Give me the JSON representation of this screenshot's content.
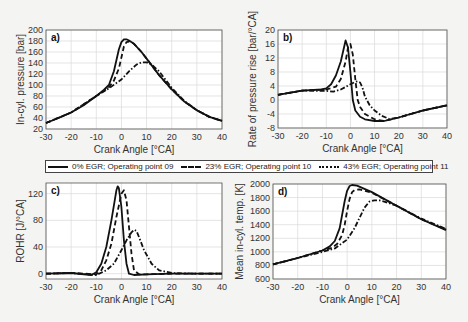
{
  "legend": {
    "items": [
      {
        "label": "0% EGR; Operating point 09",
        "style": "solid"
      },
      {
        "label": "23% EGR; Operating point 10",
        "style": "dashed"
      },
      {
        "label": "43% EGR; Operating point 11",
        "style": "dashdot"
      }
    ]
  },
  "chart_data": [
    {
      "panel": "a)",
      "type": "line",
      "xlabel": "Crank Angle [°CA]",
      "ylabel": "In-cyl. pressure [bar]",
      "xlim": [
        -30,
        40
      ],
      "ylim": [
        20,
        200
      ],
      "xticks": [
        -30,
        -20,
        -10,
        0,
        10,
        20,
        30,
        40
      ],
      "yticks": [
        20,
        40,
        60,
        80,
        100,
        120,
        140,
        160,
        180,
        200
      ],
      "grid": true,
      "box": {
        "x0": 46,
        "x1": 222,
        "y0": 30,
        "y1": 129
      },
      "series": [
        {
          "name": "0% EGR; Operating point 09",
          "style": "solid",
          "x": [
            -30,
            -25,
            -20,
            -15,
            -10,
            -7,
            -5,
            -3,
            -2,
            -1,
            0,
            1,
            2,
            3,
            5,
            8,
            10,
            15,
            20,
            25,
            30,
            35,
            40
          ],
          "y": [
            31,
            40,
            50,
            63,
            80,
            91,
            100,
            125,
            145,
            165,
            178,
            183,
            183,
            181,
            175,
            160,
            148,
            118,
            92,
            70,
            54,
            42,
            35
          ]
        },
        {
          "name": "23% EGR; Operating point 10",
          "style": "dashed",
          "x": [
            -30,
            -20,
            -10,
            -7,
            -5,
            -3,
            -1,
            0,
            1,
            2,
            3,
            5,
            8,
            10,
            15,
            20,
            25,
            30,
            35,
            40
          ],
          "y": [
            31,
            50,
            80,
            89,
            96,
            108,
            130,
            150,
            170,
            178,
            179,
            175,
            160,
            148,
            118,
            92,
            70,
            54,
            42,
            35
          ]
        },
        {
          "name": "43% EGR; Operating point 11",
          "style": "dashdot",
          "x": [
            -30,
            -20,
            -10,
            -5,
            0,
            3,
            6,
            8,
            10,
            12,
            15,
            20,
            25,
            30,
            35,
            40
          ],
          "y": [
            31,
            50,
            80,
            94,
            110,
            125,
            137,
            141,
            141,
            137,
            125,
            95,
            71,
            54,
            42,
            35
          ]
        }
      ]
    },
    {
      "panel": "b)",
      "type": "line",
      "xlabel": "Crank Angle [°CA]",
      "ylabel": "Rate of pressure rise [bar/°CA]",
      "xlim": [
        -30,
        40
      ],
      "ylim": [
        -8,
        20
      ],
      "xticks": [
        -30,
        -20,
        -10,
        0,
        10,
        20,
        30,
        40
      ],
      "yticks": [
        -8,
        -4,
        0,
        4,
        8,
        12,
        16,
        20
      ],
      "grid": true,
      "box": {
        "x0": 278,
        "x1": 447,
        "y0": 30,
        "y1": 128
      },
      "series": [
        {
          "name": "0% EGR; Operating point 09",
          "style": "solid",
          "x": [
            -30,
            -20,
            -12,
            -10,
            -8,
            -6,
            -4,
            -3,
            -2,
            -1,
            0,
            1,
            2,
            4,
            6,
            10,
            14,
            20,
            30,
            40
          ],
          "y": [
            1.5,
            2.7,
            3.0,
            3.3,
            4.5,
            7,
            11,
            14,
            17,
            15,
            8,
            0,
            -3,
            -4.8,
            -5.5,
            -6,
            -6,
            -5,
            -3,
            -1.5
          ]
        },
        {
          "name": "23% EGR; Operating point 10",
          "style": "dashed",
          "x": [
            -30,
            -20,
            -10,
            -6,
            -4,
            -2,
            -1,
            0,
            1,
            2,
            3,
            4,
            6,
            10,
            14,
            20,
            30,
            40
          ],
          "y": [
            1.5,
            2.7,
            3.0,
            3.8,
            6,
            11,
            15,
            16,
            13,
            6,
            0,
            -2,
            -4,
            -5.5,
            -6,
            -5,
            -3,
            -1.5
          ]
        },
        {
          "name": "43% EGR; Operating point 11",
          "style": "dashdot",
          "x": [
            -30,
            -20,
            -10,
            -7,
            -4,
            0,
            2,
            3,
            4,
            5,
            6,
            8,
            10,
            13,
            16,
            20,
            30,
            40
          ],
          "y": [
            1.5,
            2.7,
            2.6,
            2.4,
            3,
            4.5,
            5.2,
            5.3,
            5,
            3.5,
            1,
            -1.5,
            -3,
            -4.5,
            -5.4,
            -5,
            -3,
            -1.5
          ]
        }
      ]
    },
    {
      "panel": "c)",
      "type": "line",
      "xlabel": "Crank Angle [°CA]",
      "ylabel": "ROHR [J/°CA]",
      "xlim": [
        -30,
        40
      ],
      "ylim": [
        -8,
        136
      ],
      "xticks": [
        -30,
        -20,
        -10,
        0,
        10,
        20,
        30,
        40
      ],
      "yticks": [
        0,
        40,
        80,
        120
      ],
      "grid": true,
      "box": {
        "x0": 46,
        "x1": 222,
        "y0": 183,
        "y1": 279
      },
      "series": [
        {
          "name": "0% EGR; Operating point 09",
          "style": "solid",
          "x": [
            -30,
            -20,
            -12,
            -10,
            -8,
            -6,
            -4,
            -2,
            -1.5,
            -1,
            0,
            1,
            2,
            3,
            5,
            10,
            20,
            40
          ],
          "y": [
            0,
            1,
            -2,
            2,
            15,
            40,
            80,
            125,
            131,
            128,
            100,
            50,
            15,
            0,
            -2,
            -1,
            0,
            0
          ]
        },
        {
          "name": "23% EGR; Operating point 10",
          "style": "dashed",
          "x": [
            -30,
            -20,
            -10,
            -8,
            -6,
            -4,
            -2,
            0,
            1,
            2,
            3,
            4,
            5,
            7,
            10,
            20,
            40
          ],
          "y": [
            0,
            1,
            -1,
            5,
            20,
            45,
            85,
            120,
            125,
            110,
            70,
            30,
            5,
            -1,
            -1,
            0,
            0
          ]
        },
        {
          "name": "43% EGR; Operating point 11",
          "style": "dashdot",
          "x": [
            -30,
            -20,
            -10,
            -6,
            -3,
            0,
            2,
            4,
            5,
            6,
            7,
            9,
            12,
            15,
            20,
            30,
            40
          ],
          "y": [
            0,
            1,
            -2,
            5,
            15,
            35,
            50,
            62,
            66,
            64,
            55,
            35,
            15,
            5,
            1,
            0,
            0
          ]
        }
      ]
    },
    {
      "panel": "d)",
      "type": "line",
      "xlabel": "Crank Angle [°CA]",
      "ylabel": "Mean in-cyl. temp. [K]",
      "xlim": [
        -30,
        40
      ],
      "ylim": [
        600,
        2000
      ],
      "xticks": [
        -30,
        -20,
        -10,
        0,
        10,
        20,
        30,
        40
      ],
      "yticks": [
        600,
        800,
        1000,
        1200,
        1400,
        1600,
        1800,
        2000
      ],
      "grid": true,
      "box": {
        "x0": 273,
        "x1": 446,
        "y0": 184,
        "y1": 279
      },
      "series": [
        {
          "name": "0% EGR; Operating point 09",
          "style": "solid",
          "x": [
            -30,
            -20,
            -10,
            -7,
            -5,
            -3,
            -2,
            -1,
            0,
            1,
            2,
            4,
            10,
            20,
            30,
            40
          ],
          "y": [
            815,
            910,
            1020,
            1080,
            1160,
            1350,
            1550,
            1750,
            1900,
            1970,
            1985,
            1975,
            1880,
            1680,
            1480,
            1320
          ]
        },
        {
          "name": "23% EGR; Operating point 10",
          "style": "dashed",
          "x": [
            -30,
            -20,
            -10,
            -6,
            -4,
            -2,
            -1,
            0,
            1,
            2,
            3,
            5,
            10,
            20,
            30,
            40
          ],
          "y": [
            815,
            910,
            1020,
            1060,
            1120,
            1250,
            1400,
            1600,
            1780,
            1880,
            1910,
            1920,
            1870,
            1680,
            1480,
            1330
          ]
        },
        {
          "name": "43% EGR; Operating point 11",
          "style": "dashdot",
          "x": [
            -30,
            -20,
            -10,
            -5,
            0,
            3,
            5,
            7,
            9,
            11,
            13,
            15,
            20,
            30,
            40
          ],
          "y": [
            815,
            910,
            1000,
            1050,
            1180,
            1350,
            1500,
            1650,
            1740,
            1760,
            1760,
            1740,
            1680,
            1490,
            1340
          ]
        }
      ]
    }
  ]
}
